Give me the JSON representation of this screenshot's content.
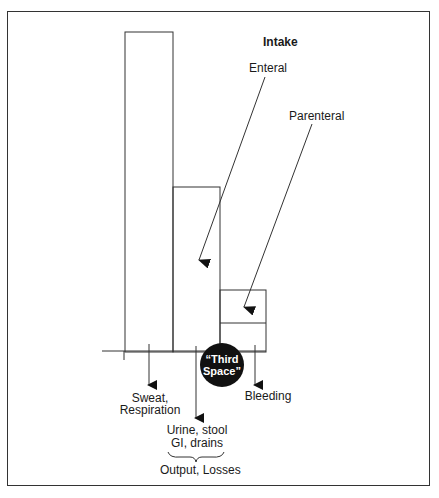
{
  "diagram": {
    "title": "Intake",
    "intake_labels": {
      "enteral": "Enteral",
      "parenteral": "Parenteral"
    },
    "third_space": {
      "line1": "“Third",
      "line2": "Space”",
      "fill_color": "#111111",
      "text_color": "#ffffff"
    },
    "outputs": {
      "sweat_line1": "Sweat,",
      "sweat_line2": "Respiration",
      "urine_line1": "Urine, stool",
      "urine_line2": "GI, drains",
      "bleeding": "Bleeding"
    },
    "brace_label": "Output, Losses",
    "line_color": "#333333"
  }
}
